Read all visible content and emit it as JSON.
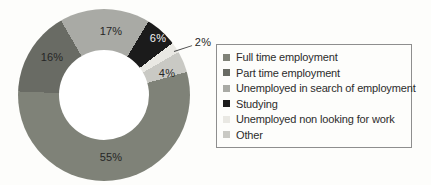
{
  "chart_data": {
    "type": "pie",
    "subtype": "donut",
    "start_angle_deg": 74.4,
    "hole_ratio": 0.52,
    "legend_position": "right",
    "label_text_color": "#262626",
    "label_text_color_on_dark": "#f4f4f4",
    "slices": [
      {
        "label": "Full time employment",
        "value": 55,
        "pct_label": "55%",
        "color": "#7f8278"
      },
      {
        "label": "Part time employment",
        "value": 16,
        "pct_label": "16%",
        "color": "#696b64"
      },
      {
        "label": "Unemployed in search of employment",
        "value": 17,
        "pct_label": "17%",
        "color": "#a9aaa5"
      },
      {
        "label": "Studying",
        "value": 6,
        "pct_label": "6%",
        "color": "#1b1b1b"
      },
      {
        "label": "Unemployed non looking for work",
        "value": 2,
        "pct_label": "2%",
        "color": "#e9e8e3"
      },
      {
        "label": "Other",
        "value": 4,
        "pct_label": "4%",
        "color": "#c9c9c4"
      }
    ]
  }
}
